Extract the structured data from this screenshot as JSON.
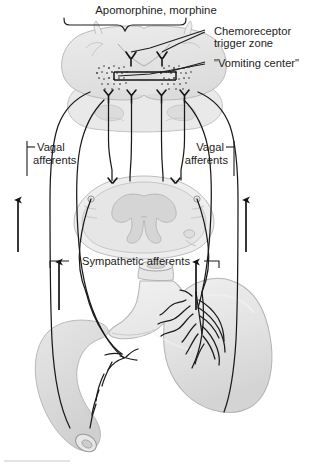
{
  "figure": {
    "background_color": "#ffffff",
    "ink_color": "#1d1d1d",
    "organ_fill_color": "#e3e3e3",
    "organ_stroke_color": "#b5b5b5"
  },
  "labels": {
    "drugs": "Apomorphine, morphine",
    "ctz_line1": "Chemoreceptor",
    "ctz_line2": "trigger zone",
    "vomiting_center": "\"Vomiting center\"",
    "vagal_left_line1": "Vagal",
    "vagal_left_line2": "afferents",
    "vagal_right_line1": "Vagal",
    "vagal_right_line2": "afferents",
    "sympathetic": "Sympathetic afferents"
  },
  "structures": {
    "brainstem": "medulla-oblongata-cross-section",
    "spinal_cord": "spinal-cord-cross-section",
    "stomach": "stomach",
    "duodenum": "duodenum"
  },
  "arrows": {
    "outer_left": "afferent-flow-up",
    "outer_right": "afferent-flow-up",
    "inner_left": "sympathetic-flow-up",
    "inner_right": "sympathetic-flow-up"
  }
}
